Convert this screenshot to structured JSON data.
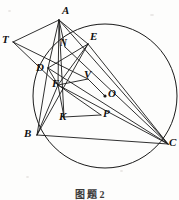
{
  "figure": {
    "type": "euclidean-geometry-diagram",
    "caption": "图 题 2",
    "canvas": {
      "width": 179,
      "height": 200
    },
    "circle": {
      "label": "circumcircle",
      "center_label": "O",
      "cx": 105,
      "cy": 96,
      "r": 72
    },
    "points": [
      {
        "name": "A",
        "label": "A",
        "x": 59,
        "y": 20,
        "lx": 62,
        "ly": 5,
        "dot": false
      },
      {
        "name": "T",
        "label": "T",
        "x": 13,
        "y": 42,
        "lx": 2,
        "ly": 34,
        "dot": false
      },
      {
        "name": "E",
        "label": "E",
        "x": 88,
        "y": 44,
        "lx": 90,
        "ly": 31,
        "dot": false
      },
      {
        "name": "N",
        "label": "N",
        "x": 65,
        "y": 47,
        "lx": 60,
        "ly": 39,
        "dot": false,
        "small": true
      },
      {
        "name": "D",
        "label": "D",
        "x": 48,
        "y": 68,
        "lx": 36,
        "ly": 62,
        "dot": false
      },
      {
        "name": "V",
        "label": "V",
        "x": 88,
        "y": 79,
        "lx": 84,
        "ly": 69,
        "dot": false
      },
      {
        "name": "O",
        "label": "O",
        "x": 105,
        "y": 96,
        "lx": 108,
        "ly": 88,
        "dot": true
      },
      {
        "name": "F",
        "label": "F",
        "x": 58,
        "y": 85,
        "lx": 52,
        "ly": 78,
        "dot": false
      },
      {
        "name": "K",
        "label": "K",
        "x": 64,
        "y": 117,
        "lx": 59,
        "ly": 111,
        "dot": false
      },
      {
        "name": "P",
        "label": "P",
        "x": 101,
        "y": 115,
        "lx": 103,
        "ly": 108,
        "dot": false
      },
      {
        "name": "B",
        "label": "B",
        "x": 37,
        "y": 135,
        "lx": 24,
        "ly": 128,
        "dot": false
      },
      {
        "name": "C",
        "label": "C",
        "x": 168,
        "y": 144,
        "lx": 169,
        "ly": 137,
        "dot": false
      }
    ],
    "segments": [
      {
        "name": "A-T",
        "from": "A",
        "to": "T"
      },
      {
        "name": "A-D",
        "from": "A",
        "to": "D"
      },
      {
        "name": "A-N",
        "from": "A",
        "to": "N"
      },
      {
        "name": "A-F",
        "from": "A",
        "to": "F"
      },
      {
        "name": "A-E",
        "from": "A",
        "to": "E"
      },
      {
        "name": "A-K",
        "from": "A",
        "to": "K"
      },
      {
        "name": "A-C",
        "from": "A",
        "to": "C"
      },
      {
        "name": "T-F",
        "from": "T",
        "to": "F"
      },
      {
        "name": "T-V",
        "from": "T",
        "to": "V"
      },
      {
        "name": "D-E",
        "from": "D",
        "to": "E"
      },
      {
        "name": "D-F",
        "from": "D",
        "to": "F"
      },
      {
        "name": "D-B",
        "from": "D",
        "to": "B"
      },
      {
        "name": "D-C",
        "from": "D",
        "to": "C"
      },
      {
        "name": "E-F",
        "from": "E",
        "to": "F"
      },
      {
        "name": "E-B",
        "from": "E",
        "to": "B"
      },
      {
        "name": "E-C",
        "from": "E",
        "to": "C"
      },
      {
        "name": "F-V",
        "from": "F",
        "to": "V"
      },
      {
        "name": "F-B",
        "from": "F",
        "to": "B"
      },
      {
        "name": "F-K",
        "from": "F",
        "to": "K"
      },
      {
        "name": "F-P",
        "from": "F",
        "to": "P"
      },
      {
        "name": "F-C",
        "from": "F",
        "to": "C"
      },
      {
        "name": "V-O",
        "from": "V",
        "to": "O"
      },
      {
        "name": "K-P",
        "from": "K",
        "to": "P"
      },
      {
        "name": "B-C",
        "from": "B",
        "to": "C"
      },
      {
        "name": "N-C",
        "from": "N",
        "to": "C"
      }
    ]
  }
}
